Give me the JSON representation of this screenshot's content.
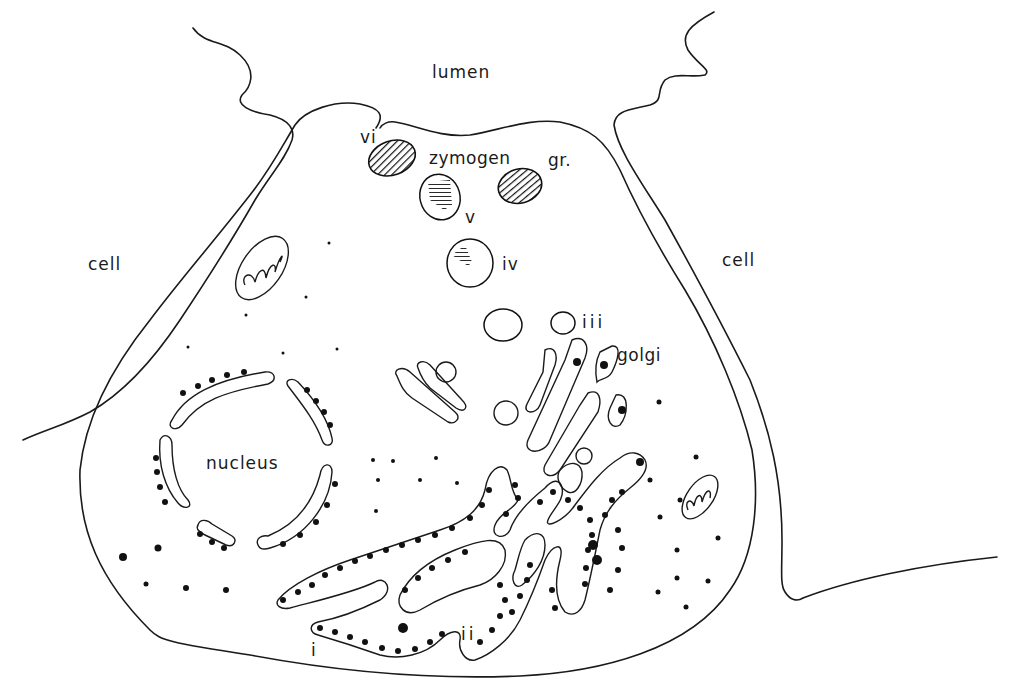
{
  "diagram": {
    "kind": "cell schematic (secretory acinar cell)",
    "colors": {
      "line": "#1a1a1a",
      "background": "#ffffff"
    },
    "labels": {
      "lumen": "lumen",
      "cell_left": "cell",
      "cell_right": "cell",
      "zymogen": "zymogen",
      "granule": "gr.",
      "golgi": "golgi",
      "nucleus": "nucleus",
      "stage_i": "i",
      "stage_ii": "ii",
      "stage_iii": "iii",
      "stage_iv": "iv",
      "stage_v": "v",
      "stage_vi": "vi"
    },
    "structures": [
      "lumen",
      "neighbouring cell (left)",
      "neighbouring cell (right)",
      "cell membrane",
      "nucleus with nuclear envelope",
      "rough endoplasmic reticulum with ribosomes",
      "golgi apparatus",
      "condensing vacuoles",
      "zymogen granules",
      "mitochondria"
    ]
  }
}
